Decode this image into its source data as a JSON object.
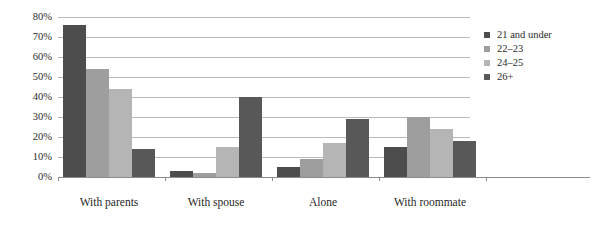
{
  "chart_data": {
    "type": "bar",
    "title": "",
    "subtitle": "",
    "xlabel": "",
    "ylabel": "",
    "ylim": [
      0,
      80
    ],
    "ytick_labels": [
      "0%",
      "10%",
      "20%",
      "30%",
      "40%",
      "50%",
      "60%",
      "70%",
      "80%"
    ],
    "ytick_values": [
      0,
      10,
      20,
      30,
      40,
      50,
      60,
      70,
      80
    ],
    "grid": true,
    "legend_position": "right",
    "categories": [
      "With parents",
      "With spouse",
      "Alone",
      "With roommate"
    ],
    "series": [
      {
        "name": "21 and under",
        "color": "#4d4d4d",
        "values": [
          76,
          3,
          5,
          15
        ]
      },
      {
        "name": "22–23",
        "color": "#9e9e9e",
        "values": [
          54,
          2,
          9,
          30
        ]
      },
      {
        "name": "24–25",
        "color": "#b5b5b5",
        "values": [
          44,
          15,
          17,
          24
        ]
      },
      {
        "name": "26+",
        "color": "#585858",
        "values": [
          14,
          40,
          29,
          18
        ]
      }
    ]
  }
}
